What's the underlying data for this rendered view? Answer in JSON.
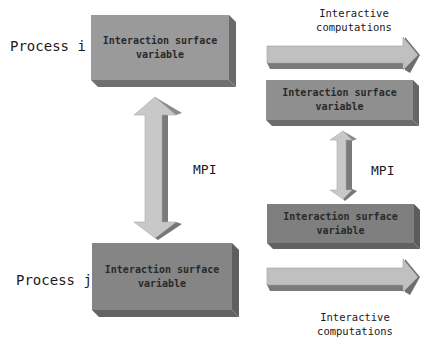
{
  "left_column": {
    "process_i_label": "Process i",
    "process_j_label": "Process j",
    "top_box": {
      "text_line1": "Interaction surface",
      "text_line2": "variable",
      "face_color": "#9a9a9a"
    },
    "bottom_box": {
      "text_line1": "Interaction surface",
      "text_line2": "variable",
      "face_color": "#858585"
    },
    "mpi_label": "MPI"
  },
  "right_column": {
    "top_computation_label_line1": "Interactive",
    "top_computation_label_line2": "computations",
    "top_box": {
      "text_line1": "Interaction surface",
      "text_line2": "variable",
      "face_color": "#8f8f8f"
    },
    "bottom_box": {
      "text_line1": "Interaction surface",
      "text_line2": "variable",
      "face_color": "#7f7f7f"
    },
    "mpi_label": "MPI",
    "bottom_computation_label_line1": "Interactive",
    "bottom_computation_label_line2": "computations"
  },
  "colors": {
    "arrow_light": "#c8c8c8",
    "arrow_dark": "#7a7a7a",
    "box_side": "#6a6a6a",
    "box_bottom": "#707070"
  }
}
